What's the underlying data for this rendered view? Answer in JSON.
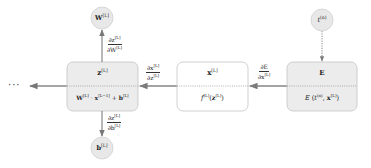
{
  "diagram": {
    "type": "backpropagation-computational-graph",
    "colors": {
      "node_fill_gray": "#ececec",
      "node_fill_white": "#ffffff",
      "node_border": "#bdbdbd",
      "arrow": "#888888",
      "dotted_line": "#999999",
      "circle_fill": "#e6e6e6"
    },
    "ellipsis": "···",
    "nodes": [
      {
        "id": "linear",
        "top": "z[L]",
        "bottom": "W[L] · x[L−1] + b[L]",
        "fill": "gray"
      },
      {
        "id": "activation",
        "top": "x[L]",
        "bottom": "f[L](z[L])",
        "fill": "white"
      },
      {
        "id": "error",
        "top": "E",
        "bottom": "E (t(n), x[L])",
        "fill": "gray"
      }
    ],
    "circles": [
      {
        "id": "weights",
        "label": "W[L]"
      },
      {
        "id": "bias",
        "label": "b[L]"
      },
      {
        "id": "target",
        "label": "t(n)"
      }
    ],
    "edges": [
      {
        "from": "linear",
        "to": "weights",
        "num": "∂z[L]",
        "den": "∂W[L]"
      },
      {
        "from": "linear",
        "to": "bias",
        "num": "∂z[L]",
        "den": "∂b[L]"
      },
      {
        "from": "activation",
        "to": "linear",
        "num": "∂x[L]",
        "den": "∂z[L]"
      },
      {
        "from": "error",
        "to": "activation",
        "num": "∂E",
        "den": "∂x[L]"
      },
      {
        "from": "target",
        "to": "error",
        "style": "dotted"
      }
    ]
  },
  "labels": {
    "ellipsis": "···",
    "w_circle": "W",
    "w_sup": "[L]",
    "b_circle": "b",
    "b_sup": "[L]",
    "t_circle": "t",
    "t_sup": "(n)",
    "node1_top": "z",
    "node1_top_sup": "[L]",
    "node1_bot_W": "W",
    "node1_bot_W_sup": "[L]",
    "node1_bot_dot": " · ",
    "node1_bot_x": "x",
    "node1_bot_x_sup": "[L−1]",
    "node1_bot_plus": " + ",
    "node1_bot_b": "b",
    "node1_bot_b_sup": "[L]",
    "node2_top": "x",
    "node2_top_sup": "[L]",
    "node2_bot_f": "f",
    "node2_bot_f_sup": "[L]",
    "node2_bot_open": "(",
    "node2_bot_z": "z",
    "node2_bot_z_sup": "[L]",
    "node2_bot_close": ")",
    "node3_top": "E",
    "node3_bot_E": "E",
    "node3_bot_open": " (",
    "node3_bot_t": "t",
    "node3_bot_t_sup": "(n)",
    "node3_bot_comma": ", ",
    "node3_bot_x": "x",
    "node3_bot_x_sup": "[L]",
    "node3_bot_close": ")",
    "dzdW_num": "∂z",
    "dzdW_num_sup": "[L]",
    "dzdW_den": "∂W",
    "dzdW_den_sup": "[L]",
    "dzdb_num": "∂z",
    "dzdb_num_sup": "[L]",
    "dzdb_den": "∂b",
    "dzdb_den_sup": "[L]",
    "dxdz_num": "∂x",
    "dxdz_num_sup": "[L]",
    "dxdz_den": "∂z",
    "dxdz_den_sup": "[L]",
    "dEdx_num": "∂E",
    "dEdx_den": "∂x",
    "dEdx_den_sup": "[L]"
  }
}
